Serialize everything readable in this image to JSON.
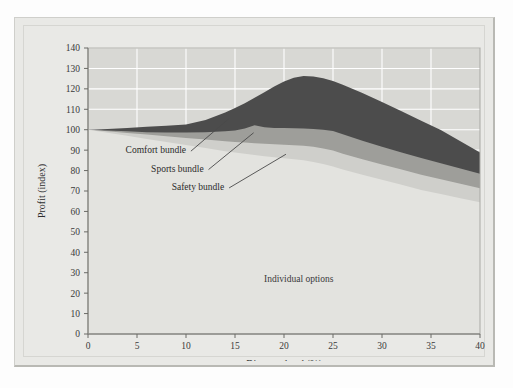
{
  "figure": {
    "background_color": "#e9e9e6",
    "plot_background_color": "#d8d8d4"
  },
  "chart_data": {
    "type": "area",
    "title": "",
    "subtitle": "",
    "xlabel": "Discount level (%)",
    "ylabel": "Profit (index)",
    "xlim": [
      0,
      40
    ],
    "ylim": [
      0,
      140
    ],
    "xticks": [
      0,
      5,
      10,
      15,
      20,
      25,
      30,
      35,
      40
    ],
    "xtick_labels": [
      "0",
      "5",
      "10",
      "15",
      "20",
      "25",
      "30",
      "35",
      "40"
    ],
    "yticks": [
      0,
      10,
      20,
      30,
      40,
      50,
      60,
      70,
      80,
      90,
      100,
      110,
      120,
      130,
      140
    ],
    "ytick_labels": [
      "0",
      "10",
      "20",
      "30",
      "40",
      "50",
      "60",
      "70",
      "80",
      "90",
      "100",
      "110",
      "120",
      "130",
      "140"
    ],
    "grid": "horizontal and vertical white gridlines",
    "legend_position": "inline annotations with leader lines",
    "stacked": true,
    "x": [
      0,
      2,
      4,
      6,
      8,
      10,
      12,
      14,
      15,
      16,
      17,
      18,
      19,
      20,
      21,
      22,
      23,
      24,
      25,
      26,
      28,
      30,
      32,
      34,
      36,
      38,
      40
    ],
    "series": [
      {
        "name": "Individual options",
        "color": "#e3e3df",
        "annotation": "Individual options",
        "cumulative_top": [
          100,
          98.5,
          97.0,
          95.5,
          94.0,
          92.5,
          91.0,
          89.5,
          88.8,
          88.2,
          87.6,
          87.0,
          86.5,
          86.0,
          85.5,
          85.0,
          84.2,
          83.2,
          82.0,
          80.5,
          78.0,
          75.5,
          73.0,
          70.5,
          68.5,
          66.5,
          64.5
        ]
      },
      {
        "name": "Safety bundle",
        "color": "#cfcfcb",
        "annotation": "Safety bundle",
        "cumulative_top": [
          100,
          99.2,
          98.4,
          97.6,
          96.8,
          96.0,
          95.2,
          94.4,
          94.0,
          93.7,
          93.4,
          93.1,
          92.9,
          92.7,
          92.4,
          92.1,
          91.6,
          90.8,
          89.8,
          88.2,
          85.5,
          83.0,
          80.5,
          78.0,
          75.8,
          73.6,
          71.4
        ]
      },
      {
        "name": "Sports bundle",
        "color": "#9e9e9a",
        "annotation": "Sports bundle",
        "cumulative_top": [
          100,
          99.6,
          99.2,
          98.8,
          98.6,
          98.6,
          98.8,
          99.2,
          99.6,
          100.6,
          102.2,
          101.2,
          100.9,
          100.8,
          100.7,
          100.6,
          100.4,
          100.0,
          99.4,
          97.8,
          94.6,
          91.6,
          88.8,
          86.2,
          83.6,
          81.0,
          78.4
        ]
      },
      {
        "name": "Comfort bundle",
        "color": "#4c4c4c",
        "annotation": "Comfort bundle",
        "cumulative_top": [
          100,
          100.4,
          100.9,
          101.4,
          101.9,
          102.6,
          104.8,
          108.4,
          110.6,
          113.0,
          115.6,
          118.4,
          121.2,
          123.6,
          125.4,
          126.3,
          126.0,
          125.2,
          123.8,
          122.0,
          118.0,
          113.6,
          109.0,
          104.4,
          99.8,
          94.4,
          88.8
        ]
      }
    ],
    "annotations": [
      {
        "text": "Comfort bundle",
        "target_series": "Comfort bundle"
      },
      {
        "text": "Sports bundle",
        "target_series": "Sports bundle"
      },
      {
        "text": "Safety bundle",
        "target_series": "Safety bundle"
      },
      {
        "text": "Individual options",
        "target_series": "Individual options"
      }
    ]
  }
}
